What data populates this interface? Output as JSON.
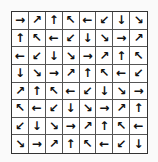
{
  "puzzle": {
    "rows": 8,
    "cols": 8,
    "grid": [
      [
        "→",
        "↗",
        "↑",
        "↖",
        "←",
        "↙",
        "↓",
        "↘"
      ],
      [
        "↑",
        "↖",
        "←",
        "↙",
        "↓",
        "↘",
        "→",
        "↗"
      ],
      [
        "←",
        "↙",
        "↓",
        "↘",
        "→",
        "↗",
        "↑",
        "↖"
      ],
      [
        "↓",
        "↘",
        "→",
        "↗",
        "↑",
        "↖",
        "←",
        "↙"
      ],
      [
        "↗",
        "↑",
        "↖",
        "←",
        "↙",
        "↓",
        "↘",
        "→"
      ],
      [
        "↖",
        "←",
        "↙",
        "↓",
        "↘",
        "→",
        "↗",
        "↑"
      ],
      [
        "↙",
        "↓",
        "↘",
        "→",
        "↗",
        "↑",
        "↖",
        "←"
      ],
      [
        "↘",
        "→",
        "↗",
        "↑",
        "↖",
        "←",
        "↙",
        "↓"
      ]
    ]
  }
}
